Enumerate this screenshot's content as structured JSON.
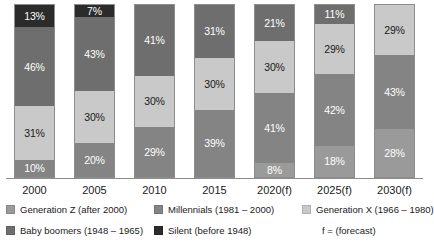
{
  "chart_data": {
    "type": "bar",
    "subtype": "stacked-percent",
    "title": "",
    "subtitle": "",
    "xlabel": "",
    "ylabel": "",
    "ylim": [
      0,
      100
    ],
    "grid": false,
    "legend_position": "bottom",
    "value_suffix": "%",
    "categories": [
      "2000",
      "2005",
      "2010",
      "2015",
      "2020(f)",
      "2025(f)",
      "2030(f)"
    ],
    "stack_order_bottom_to_top": [
      "Generation Z",
      "Millennials",
      "Generation X",
      "Baby boomers",
      "Silent"
    ],
    "series": [
      {
        "name": "Generation Z",
        "key": "genz",
        "legend_label": "Generation Z (after 2000)",
        "color": "#9a9a9a",
        "values": [
          null,
          null,
          null,
          null,
          8,
          18,
          28
        ],
        "labels": [
          "",
          "",
          "",
          "",
          "8%",
          "18%",
          "28%"
        ]
      },
      {
        "name": "Millennials",
        "key": "millennials",
        "legend_label": "Millennials (1981 – 2000)",
        "color": "#848484",
        "values": [
          10,
          20,
          29,
          39,
          41,
          42,
          43
        ],
        "labels": [
          "10%",
          "20%",
          "29%",
          "39%",
          "41%",
          "42%",
          "43%"
        ]
      },
      {
        "name": "Generation X",
        "key": "genx",
        "legend_label": "Generation X (1966 – 1980)",
        "color": "#c9c9c9",
        "values": [
          31,
          30,
          30,
          30,
          30,
          29,
          29
        ],
        "labels": [
          "31%",
          "30%",
          "30%",
          "30%",
          "30%",
          "29%",
          "29%"
        ]
      },
      {
        "name": "Baby boomers",
        "key": "boomers",
        "legend_label": "Baby boomers (1948 – 1965)",
        "color": "#6e6e6e",
        "values": [
          46,
          43,
          41,
          31,
          21,
          11,
          null
        ],
        "labels": [
          "46%",
          "43%",
          "41%",
          "31%",
          "21%",
          "11%",
          ""
        ]
      },
      {
        "name": "Silent",
        "key": "silent",
        "legend_label": "Silent (before 1948)",
        "color": "#2b2b2b",
        "values": [
          13,
          7,
          null,
          null,
          null,
          null,
          null
        ],
        "labels": [
          "13%",
          "7%",
          "",
          "",
          "",
          "",
          ""
        ]
      }
    ]
  },
  "bars": [
    {
      "category": "2000",
      "segments": [
        {
          "key": "silent",
          "label": "13%",
          "value": 13
        },
        {
          "key": "boomers",
          "label": "46%",
          "value": 46
        },
        {
          "key": "genx",
          "label": "31%",
          "value": 31
        },
        {
          "key": "millennials",
          "label": "10%",
          "value": 10
        }
      ]
    },
    {
      "category": "2005",
      "segments": [
        {
          "key": "silent",
          "label": "7%",
          "value": 7
        },
        {
          "key": "boomers",
          "label": "43%",
          "value": 43
        },
        {
          "key": "genx",
          "label": "30%",
          "value": 30
        },
        {
          "key": "millennials",
          "label": "20%",
          "value": 20
        }
      ]
    },
    {
      "category": "2010",
      "segments": [
        {
          "key": "boomers",
          "label": "41%",
          "value": 41
        },
        {
          "key": "genx",
          "label": "30%",
          "value": 30
        },
        {
          "key": "millennials",
          "label": "29%",
          "value": 29
        }
      ]
    },
    {
      "category": "2015",
      "segments": [
        {
          "key": "boomers",
          "label": "31%",
          "value": 31
        },
        {
          "key": "genx",
          "label": "30%",
          "value": 30
        },
        {
          "key": "millennials",
          "label": "39%",
          "value": 39
        }
      ]
    },
    {
      "category": "2020(f)",
      "segments": [
        {
          "key": "boomers",
          "label": "21%",
          "value": 21
        },
        {
          "key": "genx",
          "label": "30%",
          "value": 30
        },
        {
          "key": "millennials",
          "label": "41%",
          "value": 41
        },
        {
          "key": "genz",
          "label": "8%",
          "value": 8
        }
      ]
    },
    {
      "category": "2025(f)",
      "segments": [
        {
          "key": "boomers",
          "label": "11%",
          "value": 11
        },
        {
          "key": "genx",
          "label": "29%",
          "value": 29
        },
        {
          "key": "millennials",
          "label": "42%",
          "value": 42
        },
        {
          "key": "genz",
          "label": "18%",
          "value": 18
        }
      ]
    },
    {
      "category": "2030(f)",
      "segments": [
        {
          "key": "genx",
          "label": "29%",
          "value": 29
        },
        {
          "key": "millennials",
          "label": "43%",
          "value": 43
        },
        {
          "key": "genz",
          "label": "28%",
          "value": 28
        }
      ]
    }
  ],
  "axis": {
    "labels": [
      "2000",
      "2005",
      "2010",
      "2015",
      "2020(f)",
      "2025(f)",
      "2030(f)"
    ]
  },
  "legend": {
    "row1": [
      {
        "key": "genz",
        "label": "Generation Z (after 2000)"
      },
      {
        "key": "millennials",
        "label": "Millennials (1981 – 2000)"
      },
      {
        "key": "genx",
        "label": "Generation X (1966 – 1980)"
      }
    ],
    "row2": [
      {
        "key": "boomers",
        "label": "Baby boomers (1948 – 1965)"
      },
      {
        "key": "silent",
        "label": "Silent (before 1948)"
      }
    ],
    "note": "f = (forecast)"
  }
}
